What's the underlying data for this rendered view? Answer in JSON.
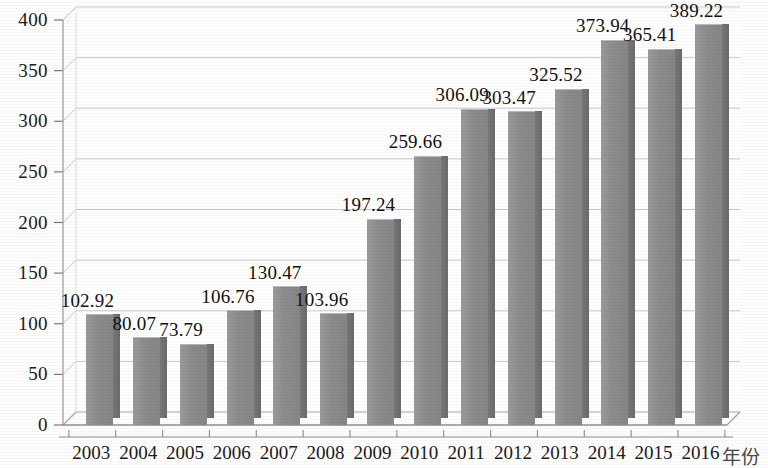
{
  "chart_data": {
    "type": "bar",
    "title": "",
    "subtitle": "",
    "xlabel": "年份",
    "ylabel": "",
    "categories": [
      "2003",
      "2004",
      "2005",
      "2006",
      "2007",
      "2008",
      "2009",
      "2010",
      "2011",
      "2012",
      "2013",
      "2014",
      "2015",
      "2016"
    ],
    "values": [
      102.92,
      80.07,
      73.79,
      106.76,
      130.47,
      103.96,
      197.24,
      259.66,
      306.09,
      303.47,
      325.52,
      373.94,
      365.41,
      389.22
    ],
    "data_labels": [
      "102.92",
      "80.07",
      "73.79",
      "106.76",
      "130.47",
      "103.96",
      "197.24",
      "259.66",
      "306.09",
      "303.47",
      "325.52",
      "373.94",
      "365.41",
      "389.22"
    ],
    "ylim": [
      0,
      400
    ],
    "ytick_values": [
      0,
      50,
      100,
      150,
      200,
      250,
      300,
      350,
      400
    ],
    "ytick_labels": [
      "0",
      "50",
      "100",
      "150",
      "200",
      "250",
      "300",
      "350",
      "400"
    ],
    "grid": true,
    "grid_axis": "y",
    "legend": null,
    "legend_position": "none",
    "series": [
      {
        "name": "",
        "values": [
          102.92,
          80.07,
          73.79,
          106.76,
          130.47,
          103.96,
          197.24,
          259.66,
          306.09,
          303.47,
          325.52,
          373.94,
          365.41,
          389.22
        ]
      }
    ],
    "style": {
      "bar_face_color": "#8d8d8d",
      "bar_side_color": "#6f6f6f",
      "bar_top_color": "#b6b6b6",
      "grid_color": "#c9c9c9",
      "axis_color": "#9a9a9a",
      "text_color": "#1b1b1b",
      "background_color": "#fdfdfd",
      "three_d": true
    }
  }
}
